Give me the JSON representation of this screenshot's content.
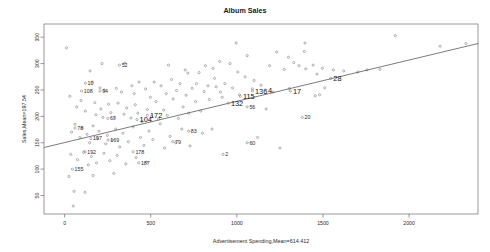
{
  "chart_data": {
    "type": "scatter",
    "title": "Album Sales",
    "xlabel": "Advertisement Spending,Mean=614.412",
    "ylabel": "Sales,Mean=197.54",
    "xlim": [
      -120,
      2400
    ],
    "ylim": [
      15,
      375
    ],
    "xticks": [
      "0",
      "500",
      "1000",
      "1500",
      "2000"
    ],
    "xtickvals": [
      0,
      500,
      1000,
      1500,
      2000
    ],
    "yticks": [
      "350",
      "300",
      "250",
      "200",
      "150",
      "100",
      "50"
    ],
    "ytickvals": [
      350,
      300,
      250,
      200,
      150,
      100,
      50
    ],
    "grid": false,
    "legend": null,
    "regression": {
      "x0": -120,
      "y0": 141,
      "x1": 2400,
      "y1": 338
    },
    "points": [
      {
        "x": 10,
        "y": 330
      },
      {
        "x": 217,
        "y": 300
      },
      {
        "x": 996,
        "y": 339
      },
      {
        "x": 1060,
        "y": 315
      },
      {
        "x": 1231,
        "y": 322
      },
      {
        "x": 1300,
        "y": 312
      },
      {
        "x": 1392,
        "y": 323
      },
      {
        "x": 1395,
        "y": 339
      },
      {
        "x": 1443,
        "y": 297
      },
      {
        "x": 1496,
        "y": 291
      },
      {
        "x": 1920,
        "y": 353
      },
      {
        "x": 2180,
        "y": 333
      },
      {
        "x": 2330,
        "y": 338
      },
      {
        "x": 350,
        "y": 301
      },
      {
        "x": 603,
        "y": 297
      },
      {
        "x": 700,
        "y": 288
      },
      {
        "x": 715,
        "y": 282
      },
      {
        "x": 780,
        "y": 283
      },
      {
        "x": 817,
        "y": 296
      },
      {
        "x": 862,
        "y": 291
      },
      {
        "x": 870,
        "y": 272
      },
      {
        "x": 900,
        "y": 304
      },
      {
        "x": 960,
        "y": 300
      },
      {
        "x": 1005,
        "y": 284
      },
      {
        "x": 1048,
        "y": 275
      },
      {
        "x": 1100,
        "y": 268
      },
      {
        "x": 1190,
        "y": 296
      },
      {
        "x": 1275,
        "y": 289
      },
      {
        "x": 1330,
        "y": 302
      },
      {
        "x": 1360,
        "y": 296
      },
      {
        "x": 1400,
        "y": 290
      },
      {
        "x": 1465,
        "y": 280
      },
      {
        "x": 1560,
        "y": 288
      },
      {
        "x": 1620,
        "y": 286
      },
      {
        "x": 1702,
        "y": 284
      },
      {
        "x": 1755,
        "y": 288
      },
      {
        "x": 1830,
        "y": 289
      },
      {
        "x": 148,
        "y": 286
      },
      {
        "x": 160,
        "y": 265
      },
      {
        "x": 205,
        "y": 254
      },
      {
        "x": 230,
        "y": 250
      },
      {
        "x": 300,
        "y": 253
      },
      {
        "x": 330,
        "y": 246
      },
      {
        "x": 390,
        "y": 258
      },
      {
        "x": 404,
        "y": 243
      },
      {
        "x": 432,
        "y": 265
      },
      {
        "x": 470,
        "y": 252
      },
      {
        "x": 498,
        "y": 236
      },
      {
        "x": 520,
        "y": 265
      },
      {
        "x": 560,
        "y": 258
      },
      {
        "x": 590,
        "y": 243
      },
      {
        "x": 620,
        "y": 270
      },
      {
        "x": 650,
        "y": 249
      },
      {
        "x": 670,
        "y": 262
      },
      {
        "x": 705,
        "y": 240
      },
      {
        "x": 740,
        "y": 253
      },
      {
        "x": 765,
        "y": 262
      },
      {
        "x": 810,
        "y": 247
      },
      {
        "x": 832,
        "y": 258
      },
      {
        "x": 880,
        "y": 256
      },
      {
        "x": 905,
        "y": 246
      },
      {
        "x": 930,
        "y": 262
      },
      {
        "x": 975,
        "y": 254
      },
      {
        "x": 1015,
        "y": 241
      },
      {
        "x": 1090,
        "y": 252
      },
      {
        "x": 1140,
        "y": 259
      },
      {
        "x": 1210,
        "y": 246
      },
      {
        "x": 1305,
        "y": 253
      },
      {
        "x": 1480,
        "y": 241
      },
      {
        "x": 1510,
        "y": 254
      },
      {
        "x": 30,
        "y": 238
      },
      {
        "x": 70,
        "y": 218
      },
      {
        "x": 95,
        "y": 230
      },
      {
        "x": 120,
        "y": 210
      },
      {
        "x": 175,
        "y": 226
      },
      {
        "x": 182,
        "y": 203
      },
      {
        "x": 210,
        "y": 214
      },
      {
        "x": 222,
        "y": 198
      },
      {
        "x": 255,
        "y": 223
      },
      {
        "x": 268,
        "y": 207
      },
      {
        "x": 290,
        "y": 196
      },
      {
        "x": 310,
        "y": 225
      },
      {
        "x": 345,
        "y": 204
      },
      {
        "x": 360,
        "y": 216
      },
      {
        "x": 385,
        "y": 197
      },
      {
        "x": 410,
        "y": 222
      },
      {
        "x": 425,
        "y": 206
      },
      {
        "x": 450,
        "y": 190
      },
      {
        "x": 480,
        "y": 213
      },
      {
        "x": 505,
        "y": 200
      },
      {
        "x": 530,
        "y": 228
      },
      {
        "x": 545,
        "y": 195
      },
      {
        "x": 575,
        "y": 212
      },
      {
        "x": 596,
        "y": 202
      },
      {
        "x": 630,
        "y": 233
      },
      {
        "x": 660,
        "y": 196
      },
      {
        "x": 688,
        "y": 218
      },
      {
        "x": 720,
        "y": 206
      },
      {
        "x": 760,
        "y": 228
      },
      {
        "x": 790,
        "y": 210
      },
      {
        "x": 840,
        "y": 232
      },
      {
        "x": 915,
        "y": 236
      },
      {
        "x": 1170,
        "y": 214
      },
      {
        "x": 1455,
        "y": 239
      },
      {
        "x": 40,
        "y": 170
      },
      {
        "x": 60,
        "y": 185
      },
      {
        "x": 88,
        "y": 160
      },
      {
        "x": 102,
        "y": 178
      },
      {
        "x": 130,
        "y": 166
      },
      {
        "x": 145,
        "y": 150
      },
      {
        "x": 165,
        "y": 182
      },
      {
        "x": 190,
        "y": 158
      },
      {
        "x": 200,
        "y": 172
      },
      {
        "x": 238,
        "y": 148
      },
      {
        "x": 248,
        "y": 164
      },
      {
        "x": 275,
        "y": 155
      },
      {
        "x": 296,
        "y": 176
      },
      {
        "x": 320,
        "y": 142
      },
      {
        "x": 338,
        "y": 168
      },
      {
        "x": 370,
        "y": 152
      },
      {
        "x": 398,
        "y": 180
      },
      {
        "x": 440,
        "y": 160
      },
      {
        "x": 460,
        "y": 145
      },
      {
        "x": 490,
        "y": 172
      },
      {
        "x": 512,
        "y": 156
      },
      {
        "x": 555,
        "y": 186
      },
      {
        "x": 580,
        "y": 140
      },
      {
        "x": 612,
        "y": 162
      },
      {
        "x": 645,
        "y": 150
      },
      {
        "x": 680,
        "y": 176
      },
      {
        "x": 728,
        "y": 144
      },
      {
        "x": 800,
        "y": 168
      },
      {
        "x": 855,
        "y": 176
      },
      {
        "x": 1120,
        "y": 160
      },
      {
        "x": 1250,
        "y": 140
      },
      {
        "x": 35,
        "y": 128
      },
      {
        "x": 75,
        "y": 118
      },
      {
        "x": 110,
        "y": 132
      },
      {
        "x": 138,
        "y": 108
      },
      {
        "x": 155,
        "y": 124
      },
      {
        "x": 185,
        "y": 112
      },
      {
        "x": 228,
        "y": 130
      },
      {
        "x": 262,
        "y": 116
      },
      {
        "x": 305,
        "y": 126
      },
      {
        "x": 355,
        "y": 110
      },
      {
        "x": 415,
        "y": 122
      },
      {
        "x": 475,
        "y": 113
      },
      {
        "x": 25,
        "y": 86
      },
      {
        "x": 165,
        "y": 88
      },
      {
        "x": 285,
        "y": 92
      },
      {
        "x": 55,
        "y": 58
      },
      {
        "x": 118,
        "y": 56
      },
      {
        "x": 50,
        "y": 30
      }
    ],
    "labeled_points": [
      {
        "label": "52",
        "x": 318,
        "y": 297,
        "size": "small"
      },
      {
        "label": "10",
        "x": 120,
        "y": 263,
        "size": "small"
      },
      {
        "label": "108",
        "x": 98,
        "y": 248,
        "size": "small"
      },
      {
        "label": "94",
        "x": 205,
        "y": 248,
        "size": "small"
      },
      {
        "label": "115",
        "x": 1020,
        "y": 238,
        "size": "big"
      },
      {
        "label": "136",
        "x": 1090,
        "y": 248,
        "size": "big"
      },
      {
        "label": "4",
        "x": 1165,
        "y": 250,
        "size": "big"
      },
      {
        "label": "17",
        "x": 1310,
        "y": 248,
        "size": "big"
      },
      {
        "label": "28",
        "x": 1545,
        "y": 272,
        "size": "big"
      },
      {
        "label": "132",
        "x": 950,
        "y": 225,
        "size": "big"
      },
      {
        "label": "172",
        "x": 480,
        "y": 202,
        "size": "big"
      },
      {
        "label": "104",
        "x": 420,
        "y": 194,
        "size": "big"
      },
      {
        "label": "56",
        "x": 1060,
        "y": 218,
        "size": "small"
      },
      {
        "label": "20",
        "x": 1380,
        "y": 198,
        "size": "small"
      },
      {
        "label": "67",
        "x": 250,
        "y": 196,
        "size": "small"
      },
      {
        "label": "78",
        "x": 60,
        "y": 178,
        "size": "small"
      },
      {
        "label": "83",
        "x": 720,
        "y": 172,
        "size": "small"
      },
      {
        "label": "197",
        "x": 152,
        "y": 158,
        "size": "small"
      },
      {
        "label": "169",
        "x": 252,
        "y": 155,
        "size": "small"
      },
      {
        "label": "79",
        "x": 628,
        "y": 152,
        "size": "small"
      },
      {
        "label": "60",
        "x": 1060,
        "y": 150,
        "size": "small"
      },
      {
        "label": "192",
        "x": 118,
        "y": 133,
        "size": "small"
      },
      {
        "label": "178",
        "x": 398,
        "y": 133,
        "size": "small"
      },
      {
        "label": "2",
        "x": 920,
        "y": 128,
        "size": "small"
      },
      {
        "label": "187",
        "x": 430,
        "y": 112,
        "size": "small"
      },
      {
        "label": "155",
        "x": 45,
        "y": 100,
        "size": "small"
      }
    ]
  }
}
